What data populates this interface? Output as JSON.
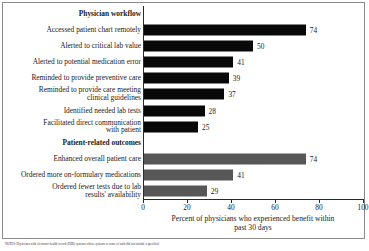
{
  "chart_data": {
    "type": "bar",
    "orientation": "horizontal",
    "title": "",
    "xlabel": "Percent of physicians who experienced benefit within\npast 30 days",
    "ylabel": "",
    "xlim": [
      0,
      100
    ],
    "xticks": [
      0,
      20,
      40,
      60,
      80,
      100
    ],
    "grid": false,
    "legend": false,
    "groups": [
      {
        "name": "Physician workflow",
        "color": "#080808",
        "categories": [
          "Accessed patient chart remotely",
          "Alerted to critical lab value",
          "Alerted to potential medication error",
          "Reminded to provide preventive care",
          "Reminded to provide care meeting\nclinical guidelines",
          "Identified needed lab tests",
          "Facilitated direct communication\nwith patient"
        ],
        "values": [
          74,
          50,
          41,
          39,
          37,
          28,
          25
        ]
      },
      {
        "name": "Patient-related outcomes",
        "color": "#575757",
        "categories": [
          "Enhanced overall patient care",
          "Ordered more on-formulary medications",
          "Ordered fewer tests due to lab\nresults' availability"
        ],
        "values": [
          74,
          41,
          29
        ]
      }
    ],
    "rows": [
      {
        "kind": "group",
        "label": "Physician workflow",
        "value": null,
        "color": null
      },
      {
        "kind": "bar",
        "label": "Accessed patient chart remotely",
        "value": 74,
        "color": "black"
      },
      {
        "kind": "bar",
        "label": "Alerted to critical lab value",
        "value": 50,
        "color": "black"
      },
      {
        "kind": "bar",
        "label": "Alerted to potential medication error",
        "value": 41,
        "color": "black"
      },
      {
        "kind": "bar",
        "label": "Reminded to provide preventive care",
        "value": 39,
        "color": "black"
      },
      {
        "kind": "bar",
        "label": "Reminded to provide care meeting\nclinical guidelines",
        "value": 37,
        "color": "black"
      },
      {
        "kind": "bar",
        "label": "Identified needed lab tests",
        "value": 28,
        "color": "black"
      },
      {
        "kind": "bar",
        "label": "Facilitated direct communication\nwith patient",
        "value": 25,
        "color": "black"
      },
      {
        "kind": "group",
        "label": "Patient-related outcomes",
        "value": null,
        "color": null
      },
      {
        "kind": "bar",
        "label": "Enhanced overall patient care",
        "value": 74,
        "color": "gray"
      },
      {
        "kind": "bar",
        "label": "Ordered more on-formulary medications",
        "value": 41,
        "color": "gray"
      },
      {
        "kind": "bar",
        "label": "Ordered fewer tests due to lab\nresults' availability",
        "value": 29,
        "color": "gray"
      }
    ]
  },
  "axis": {
    "ticks": [
      "0",
      "20",
      "40",
      "60",
      "80",
      "100"
    ],
    "title": "Percent of physicians who experienced benefit within\npast 30 days"
  },
  "footnote": {
    "text": "NOTES: Physicians with electronic health record (EHR) systems whose systems or some of such did not include a specified"
  }
}
